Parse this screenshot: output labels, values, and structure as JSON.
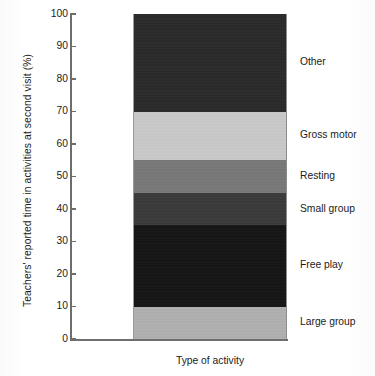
{
  "chart_data": {
    "type": "bar",
    "subtype": "stacked-bar-100pct",
    "title": "",
    "xlabel": "Type of activity",
    "ylabel": "Teachers' reported time in activities at second visit (%)",
    "ylim": [
      0,
      100
    ],
    "yticks": [
      0,
      10,
      20,
      30,
      40,
      50,
      60,
      70,
      80,
      90,
      100
    ],
    "ytick_labels": [
      "0",
      "10",
      "20",
      "30",
      "40",
      "50",
      "60",
      "70",
      "80",
      "90",
      "100"
    ],
    "grid": false,
    "legend_position": "right-inline-labels",
    "categories": [
      "Type of activity"
    ],
    "series": [
      {
        "name": "Large group",
        "values": [
          10
        ],
        "range": [
          0,
          10
        ],
        "color": "#b0b0b0"
      },
      {
        "name": "Free play",
        "values": [
          25
        ],
        "range": [
          10,
          35
        ],
        "color": "#151515"
      },
      {
        "name": "Small group",
        "values": [
          10
        ],
        "range": [
          35,
          45
        ],
        "color": "#3a3a3a"
      },
      {
        "name": "Resting",
        "values": [
          10
        ],
        "range": [
          45,
          55
        ],
        "color": "#787878"
      },
      {
        "name": "Gross motor",
        "values": [
          15
        ],
        "range": [
          55,
          70
        ],
        "color": "#c9c9c9"
      },
      {
        "name": "Other",
        "values": [
          30
        ],
        "range": [
          70,
          100
        ],
        "color": "#2a2a2a"
      }
    ],
    "segment_labels": [
      {
        "label": "Other",
        "value": 30,
        "center": 85.0
      },
      {
        "label": "Gross motor",
        "value": 15,
        "center": 62.5
      },
      {
        "label": "Resting",
        "value": 10,
        "center": 50.0
      },
      {
        "label": "Small group",
        "value": 10,
        "center": 40.0
      },
      {
        "label": "Free play",
        "value": 25,
        "center": 22.5
      },
      {
        "label": "Large group",
        "value": 10,
        "center": 5.0
      }
    ]
  }
}
